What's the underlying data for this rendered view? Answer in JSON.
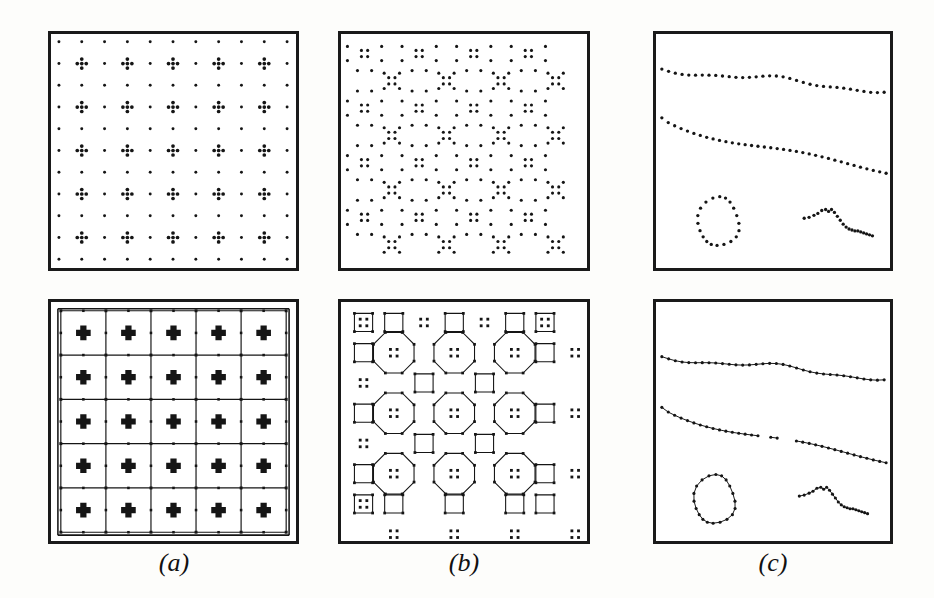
{
  "figure": {
    "background": "#fdfdfb",
    "ink": "#151515",
    "panel_border": "#1a1a1a"
  },
  "column_labels": [
    {
      "id": "a",
      "text": "(a)"
    },
    {
      "id": "b",
      "text": "(b)"
    },
    {
      "id": "c",
      "text": "(c)"
    }
  ],
  "rows": [
    {
      "id": "input",
      "caption": "Input dot patterns"
    },
    {
      "id": "grouping",
      "caption": "Extracted grouping structure"
    }
  ],
  "panels": [
    {
      "id": "a-top",
      "name": "panel-a-input",
      "row": "input",
      "column": "a",
      "content_type": "dot-pattern",
      "description": "Square lattice of single dots with 5-dot plus-shaped clusters at alternating lattice sites",
      "grid_columns": 11,
      "grid_rows": 11,
      "cluster_type": "plus-5",
      "dot_radius_px": 1.6,
      "cluster_dot_radius_px": 1.9
    },
    {
      "id": "b-top",
      "name": "panel-b-input",
      "row": "input",
      "column": "b",
      "content_type": "dot-pattern",
      "description": "Truncated-square (4.8.8) lattice of dots with 2x2 four-dot clusters at tile centres",
      "cluster_type": "quad-4",
      "dot_radius_px": 1.6
    },
    {
      "id": "c-top",
      "name": "panel-c-input",
      "row": "input",
      "content_type": "dot-curves",
      "column": "c",
      "description": "Four dotted curves: two long near-horizontal strands, a closed oval loop, and a short squiggle",
      "curve_count": 4,
      "dot_radius_px": 1.7
    },
    {
      "id": "a-bottom",
      "name": "panel-a-grouping",
      "row": "grouping",
      "column": "a",
      "content_type": "grid-graph",
      "description": "5x5 grid of rectangular cells with bold plus markers at cell centres and dots on the grid lines",
      "cells_x": 5,
      "cells_y": 5
    },
    {
      "id": "b-bottom",
      "name": "panel-b-grouping",
      "row": "grouping",
      "column": "b",
      "content_type": "octagon-square-tiling",
      "description": "Octagon and square (4.8.8) tiling drawn as polygons with four-dot cluster markers at centres",
      "octagons_x": 3,
      "octagons_y": 3
    },
    {
      "id": "c-bottom",
      "name": "panel-c-grouping",
      "row": "grouping",
      "column": "c",
      "content_type": "polyline-curves",
      "description": "The same four dot sets linked into polylines: two long strands, a closed oval, and a squiggle",
      "curve_count": 4
    }
  ],
  "geometry": {
    "panel_a": {
      "x": 48,
      "y": 31,
      "w": 251,
      "h": 240
    },
    "panel_b": {
      "x": 338,
      "y": 31,
      "w": 252,
      "h": 240
    },
    "panel_c": {
      "x": 653,
      "y": 31,
      "w": 240,
      "h": 240
    },
    "panel_a2": {
      "x": 48,
      "y": 299,
      "w": 251,
      "h": 245
    },
    "panel_b2": {
      "x": 338,
      "y": 299,
      "w": 252,
      "h": 245
    },
    "panel_c2": {
      "x": 653,
      "y": 299,
      "w": 240,
      "h": 245
    },
    "label_a": {
      "x": 134,
      "y": 548
    },
    "label_b": {
      "x": 424,
      "y": 548
    },
    "label_c": {
      "x": 733,
      "y": 548
    }
  },
  "chart_data": {
    "type": "scatter",
    "xlabel": "",
    "ylabel": "",
    "panels": [
      {
        "panel": "a-top",
        "description": "11x11 dot lattice; plus-shaped 5-dot clusters at every other lattice node in both directions",
        "lattice_spacing_x": 24.5,
        "lattice_spacing_y": 23.5,
        "cluster_offsets": [
          [
            0,
            0
          ],
          [
            0,
            -5
          ],
          [
            0,
            5
          ],
          [
            -5,
            0
          ],
          [
            5,
            0
          ]
        ]
      },
      {
        "panel": "b-top",
        "description": "Dots arranged on the vertices of a 4.8.8 tiling, with 2x2 clusters marking octagon and square centres",
        "cluster_offsets": [
          [
            -3,
            -3
          ],
          [
            3,
            -3
          ],
          [
            -3,
            3
          ],
          [
            3,
            3
          ]
        ]
      },
      {
        "panel": "c-top",
        "curves": [
          {
            "name": "upper-strand",
            "n_dots": 34,
            "orientation": "near-horizontal, slight downward drift"
          },
          {
            "name": "lower-strand",
            "n_dots": 36,
            "orientation": "descending from left to right"
          },
          {
            "name": "closed-oval",
            "n_dots": 20,
            "orientation": "closed loop, lower-left"
          },
          {
            "name": "squiggle",
            "n_dots": 22,
            "orientation": "peak then descending tail, lower-right"
          }
        ]
      },
      {
        "panel": "a-bottom",
        "description": "Grouping result: 5x5 grid graph; bold plus tokens inside cells, dots at edge midpoints and nodes"
      },
      {
        "panel": "b-bottom",
        "description": "Grouping result: octagon-square tiling polygons with 4-dot tokens at tile centres"
      },
      {
        "panel": "c-bottom",
        "description": "Grouping result: dots linked into four polylines matching the four curves in c-top"
      }
    ]
  }
}
